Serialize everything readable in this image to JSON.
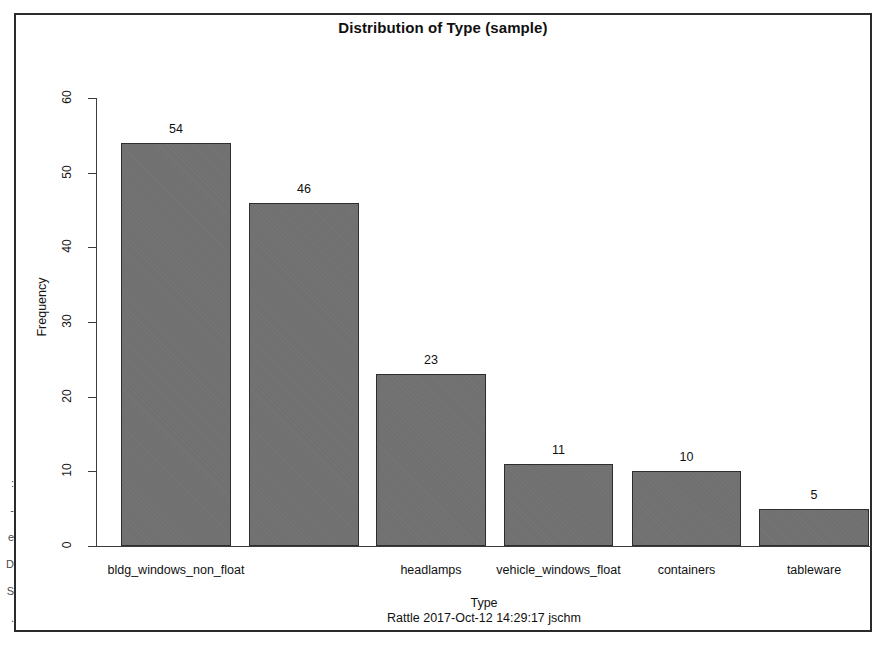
{
  "chart_data": {
    "type": "bar",
    "title": "Distribution of Type (sample)",
    "subtitle": "Rattle 2017-Oct-12 14:29:17 jschm",
    "xlabel": "Type",
    "ylabel": "Frequency",
    "ylim": [
      0,
      60
    ],
    "yticks": [
      0,
      10,
      20,
      30,
      40,
      50,
      60
    ],
    "grid": false,
    "legend": null,
    "categories": [
      "bldg_windows_non_float",
      "",
      "headlamps",
      "vehicle_windows_float",
      "containers",
      "tableware"
    ],
    "values": [
      54,
      46,
      23,
      11,
      10,
      5
    ],
    "data_labels": [
      "54",
      "46",
      "23",
      "11",
      "10",
      "5"
    ],
    "bar_color": "#717171",
    "bar_border_color": "#2e2e2e",
    "note": "second bar category label omitted in rendering due to axis label overlap"
  },
  "frame": {
    "border_color": "#2b2b2b"
  },
  "edge_artifacts": {
    "text": ":\n-\ne\nD\nS\n."
  }
}
